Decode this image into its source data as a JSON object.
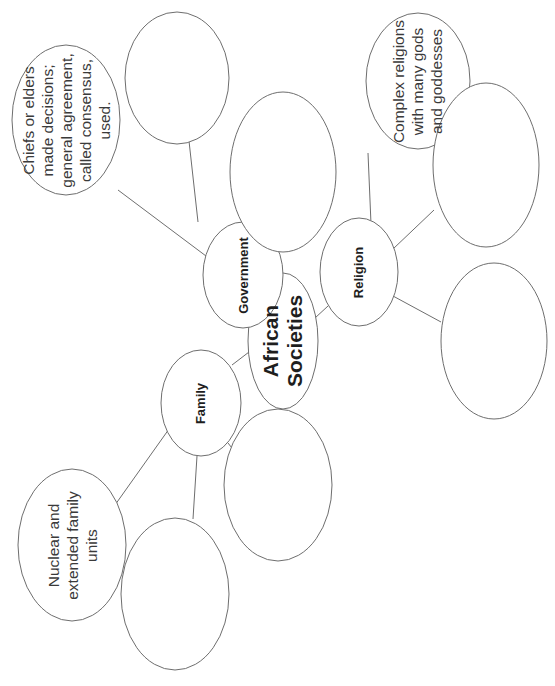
{
  "diagram": {
    "type": "web-diagram",
    "orientation": "rotated-90-ccw",
    "center": {
      "id": "african-societies",
      "lines": [
        "African",
        "Societies"
      ]
    },
    "categories": [
      {
        "id": "government",
        "label": "Government",
        "details": [
          {
            "id": "gov-detail-1",
            "lines": [
              "Chiefs or elders",
              "made decisions;",
              "general agreement,",
              "called consensus,",
              "used."
            ]
          },
          {
            "id": "gov-detail-2",
            "lines": []
          },
          {
            "id": "gov-detail-3",
            "lines": []
          }
        ]
      },
      {
        "id": "religion",
        "label": "Religion",
        "details": [
          {
            "id": "rel-detail-1",
            "lines": [
              "Complex religions",
              "with many gods",
              "and goddesses"
            ]
          },
          {
            "id": "rel-detail-2",
            "lines": []
          },
          {
            "id": "rel-detail-3",
            "lines": []
          }
        ]
      },
      {
        "id": "family",
        "label": "Family",
        "details": [
          {
            "id": "fam-detail-1",
            "lines": [
              "Nuclear and",
              "extended family",
              "units"
            ]
          },
          {
            "id": "fam-detail-2",
            "lines": []
          },
          {
            "id": "fam-detail-3",
            "lines": []
          }
        ]
      }
    ],
    "colors": {
      "stroke": "#6e6e6e",
      "text": "#1e1e1e",
      "background": "#ffffff"
    }
  }
}
